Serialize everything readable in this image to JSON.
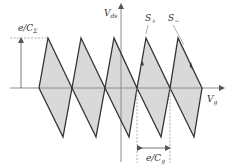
{
  "diagram": {
    "type": "triangular-waveform",
    "labels": {
      "y_axis": "V",
      "y_axis_sub": "ds",
      "x_axis": "V",
      "x_axis_sub": "g",
      "amplitude": "e/C",
      "amplitude_sub": "Σ",
      "period": "e/C",
      "period_sub": "g",
      "s_plus": "S",
      "s_plus_sub": "+",
      "s_minus": "S",
      "s_minus_sub": "−"
    },
    "colors": {
      "fill": "#d9d9d9",
      "stroke": "#333333",
      "axis": "#8c8c8c",
      "dashed": "#999999",
      "text": "#333333"
    },
    "geometry": {
      "baseline_y": 88,
      "peak_y": 38,
      "trough_y": 137,
      "crossings_x": [
        39,
        72,
        105,
        137,
        170,
        202
      ],
      "peaks_x": [
        48,
        81,
        114,
        146,
        178
      ],
      "troughs_x": [
        63,
        96,
        129,
        161,
        194
      ]
    }
  }
}
